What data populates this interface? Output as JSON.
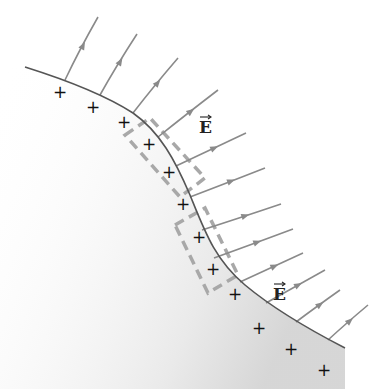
{
  "figure": {
    "colors": {
      "background": "#ffffff",
      "surface_line": "#555555",
      "surface_fill_edge": "#cfcfcf",
      "field_line": "#8a8a8a",
      "dashed_box": "#a8a8a8",
      "charge": "#111111",
      "label": "#222222"
    },
    "labels": [
      {
        "text": "E",
        "vector": true,
        "x": 199,
        "y": 133
      },
      {
        "text": "E",
        "vector": true,
        "x": 273,
        "y": 300
      }
    ],
    "charge_symbol": "+",
    "charges": [
      {
        "x": 60,
        "y": 98
      },
      {
        "x": 93,
        "y": 113
      },
      {
        "x": 124,
        "y": 128
      },
      {
        "x": 149,
        "y": 150
      },
      {
        "x": 169,
        "y": 178
      },
      {
        "x": 183,
        "y": 210
      },
      {
        "x": 199,
        "y": 243
      },
      {
        "x": 213,
        "y": 275
      },
      {
        "x": 235,
        "y": 300
      },
      {
        "x": 259,
        "y": 334
      },
      {
        "x": 291,
        "y": 355
      },
      {
        "x": 324,
        "y": 376
      }
    ],
    "surface_path": "M25,67 C60,78 105,95 133,113 C160,132 175,160 190,195 C205,232 215,260 245,285 C275,310 310,330 345,348",
    "field_lines": [
      {
        "x1": 65,
        "y1": 80,
        "x2": 98,
        "y2": 17
      },
      {
        "x1": 100,
        "y1": 95,
        "x2": 137,
        "y2": 34
      },
      {
        "x1": 133,
        "y1": 113,
        "x2": 178,
        "y2": 58
      },
      {
        "x1": 158,
        "y1": 137,
        "x2": 218,
        "y2": 90
      },
      {
        "x1": 176,
        "y1": 166,
        "x2": 246,
        "y2": 133
      },
      {
        "x1": 190,
        "y1": 197,
        "x2": 265,
        "y2": 168
      },
      {
        "x1": 202,
        "y1": 230,
        "x2": 281,
        "y2": 204
      },
      {
        "x1": 214,
        "y1": 258,
        "x2": 293,
        "y2": 229
      },
      {
        "x1": 240,
        "y1": 282,
        "x2": 303,
        "y2": 253
      },
      {
        "x1": 266,
        "y1": 303,
        "x2": 325,
        "y2": 270
      },
      {
        "x1": 296,
        "y1": 322,
        "x2": 340,
        "y2": 290
      },
      {
        "x1": 328,
        "y1": 340,
        "x2": 368,
        "y2": 305
      }
    ],
    "gaussian_surfaces": [
      {
        "name": "upper-gaussian-box",
        "points": "125,135 150,118 205,178 180,197"
      },
      {
        "name": "lower-gaussian-box",
        "points": "175,225 205,208 238,275 208,293"
      }
    ]
  }
}
